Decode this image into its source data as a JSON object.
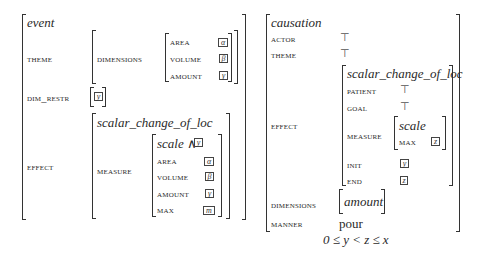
{
  "left_avm": {
    "type": "event",
    "theme_label": "THEME",
    "dimensions_label": "DIMENSIONS",
    "dimensions": [
      {
        "label": "AREA",
        "tag": "α"
      },
      {
        "label": "VOLUME",
        "tag": "β"
      },
      {
        "label": "AMOUNT",
        "tag": "γ"
      }
    ],
    "dim_restr_label": "DIM_RESTR",
    "dim_restr_tag": "y",
    "effect_label": "EFFECT",
    "effect": {
      "type": "scalar_change_of_loc",
      "measure_label": "MEASURE",
      "measure": {
        "scale_text": "scale ∧",
        "scale_tag": "y",
        "rows": [
          {
            "label": "AREA",
            "tag": "α"
          },
          {
            "label": "VOLUME",
            "tag": "β"
          },
          {
            "label": "AMOUNT",
            "tag": "γ"
          },
          {
            "label": "MAX",
            "tag": "m"
          }
        ]
      }
    }
  },
  "right_avm": {
    "type": "causation",
    "actor_label": "ACTOR",
    "actor_value": "⊤",
    "theme_label": "THEME",
    "theme_value": "⊤",
    "effect_label": "EFFECT",
    "effect": {
      "type": "scalar_change_of_loc",
      "patient_label": "PATIENT",
      "patient_value": "⊤",
      "goal_label": "GOAL",
      "goal_value": "⊤",
      "measure_label": "MEASURE",
      "measure_scale": "scale",
      "measure_max_label": "MAX",
      "measure_max_tag": "z",
      "init_label": "INIT",
      "init_tag": "y",
      "end_label": "END",
      "end_tag": "z"
    },
    "dimensions_label": "DIMENSIONS",
    "dimensions_value": "amount",
    "manner_label": "MANNER",
    "manner_value": "pour"
  },
  "constraint": "0 ≤ y < z ≤ x"
}
